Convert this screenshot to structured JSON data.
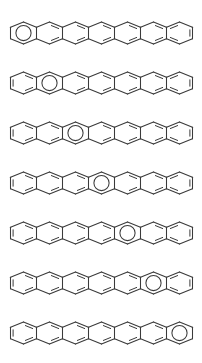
{
  "figure": {
    "background_color": "#ffffff",
    "line_color": "#3a3a3a",
    "width": 202,
    "height": 363
  },
  "geometry": {
    "ring_count": 7,
    "row_count": 7,
    "row_height": 50,
    "first_row_top": 8,
    "hex_half_width": 13.0,
    "hex_quarter_width": 6.5,
    "hex_half_height": 11.0,
    "chain_start_x": 10.5,
    "row_center_y": 25,
    "circle_radius": 7.6,
    "double_bond_offset": 2.6,
    "double_bond_shrink": 0.22
  },
  "rows": [
    {
      "index": 1,
      "label": "row-1",
      "circle_ring": 1,
      "circle_ring_label": "ring-1"
    },
    {
      "index": 2,
      "label": "row-2",
      "circle_ring": 2,
      "circle_ring_label": "ring-2"
    },
    {
      "index": 3,
      "label": "row-3",
      "circle_ring": 3,
      "circle_ring_label": "ring-3"
    },
    {
      "index": 4,
      "label": "row-4",
      "circle_ring": 4,
      "circle_ring_label": "ring-4"
    },
    {
      "index": 5,
      "label": "row-5",
      "circle_ring": 5,
      "circle_ring_label": "ring-5"
    },
    {
      "index": 6,
      "label": "row-6",
      "circle_ring": 6,
      "circle_ring_label": "ring-6"
    },
    {
      "index": 7,
      "label": "row-7",
      "circle_ring": 7,
      "circle_ring_label": "ring-7"
    }
  ]
}
